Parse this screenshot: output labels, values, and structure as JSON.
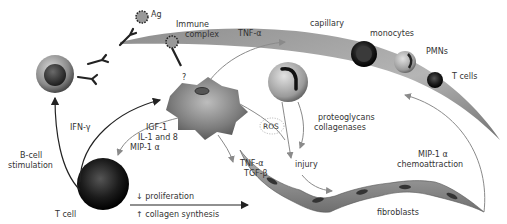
{
  "labels": {
    "ag": "Ag",
    "immune_complex_1": "Immune",
    "immune_complex_2": "complex",
    "question": "?",
    "tnf_alpha_top": "TNF-α",
    "capillary": "capillary",
    "monocytes": "monocytes",
    "pmns": "PMNs",
    "t_cells": "T cells",
    "ifn_gamma": "IFN-γ",
    "b_cell_1": "B-cell",
    "b_cell_2": "stimulation",
    "igf1": "IGF-1",
    "il1_8": "IL-1 and 8",
    "mip1a_left": "MIP-1 α",
    "ros": "ROS",
    "proteoglycans": "proteoglycans",
    "collagenases": "collagenases",
    "tnf_alpha_mid": "TNF-α",
    "tgf_beta": "TGF-β",
    "injury": "injury",
    "mip1a_right": "MIP-1 α",
    "chemoattraction": "chemoattraction",
    "proliferation": "↓ proliferation",
    "collagen_synthesis": "↑ collagen synthesis",
    "t_cell": "T cell",
    "fibroblasts": "fibroblasts"
  },
  "colors": {
    "ink": "#222222",
    "grey_arrow": "#8a8a8a",
    "cell_grey": "#8c8c8c",
    "cell_dark": "#1a1a1a"
  }
}
